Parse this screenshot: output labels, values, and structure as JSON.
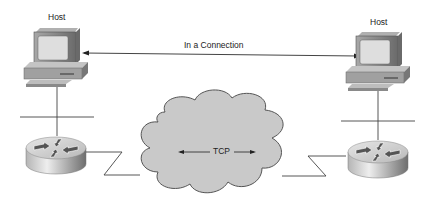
{
  "diagram": {
    "left_host": {
      "label": "Host"
    },
    "right_host": {
      "label": "Host"
    },
    "connection_label": "In a Connection",
    "cloud_label": "TCP"
  },
  "colors": {
    "line": "#333333",
    "cloud_fill": "#c8c8c8",
    "cloud_stroke": "#555555",
    "monitor_body": "#8a8a8a",
    "screen": "#d6d6d6",
    "router_top": "#d0d0d0",
    "router_side": "#9a9a9a"
  }
}
